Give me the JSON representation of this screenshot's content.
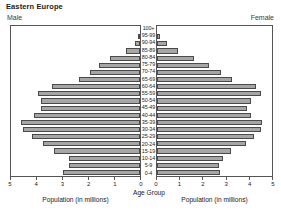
{
  "title": "Eastern Europe",
  "sides": {
    "left_label": "Male",
    "right_label": "Female"
  },
  "axis": {
    "center_caption": "Age Group",
    "left_caption": "Population (in millions)",
    "right_caption": "Population (in millions)",
    "left_ticks": [
      "5",
      "4",
      "3",
      "2",
      "1",
      "0"
    ],
    "right_ticks": [
      "0",
      "1",
      "2",
      "3",
      "4",
      "5"
    ]
  },
  "colors": {
    "bar_fill": "#a6a6a6",
    "bar_stroke": "#4a4a4a",
    "panel_border": "#555555",
    "text": "#1a1a1a"
  },
  "chart_data": {
    "type": "bar",
    "subtype": "population-pyramid",
    "title": "Eastern Europe",
    "xlabel": "Population (in millions)",
    "ylabel": "Age Group",
    "xlim": [
      0,
      5
    ],
    "grid": false,
    "legend_position": "none",
    "orientation": "horizontal",
    "categories": [
      "100+",
      "95-99",
      "90-94",
      "85-89",
      "80-84",
      "75-79",
      "70-74",
      "65-69",
      "60-64",
      "55-59",
      "50-54",
      "45-49",
      "40-44",
      "35-39",
      "30-34",
      "25-29",
      "20-24",
      "15-19",
      "10-14",
      "5-9",
      "0-4"
    ],
    "series": [
      {
        "name": "Male",
        "direction": "left",
        "values": [
          0.02,
          0.06,
          0.18,
          0.55,
          1.15,
          1.6,
          1.95,
          2.35,
          3.4,
          3.95,
          3.85,
          3.85,
          4.1,
          4.6,
          4.55,
          4.2,
          3.75,
          3.35,
          2.75,
          2.75,
          3.0
        ]
      },
      {
        "name": "Female",
        "direction": "right",
        "values": [
          0.03,
          0.15,
          0.45,
          0.9,
          1.6,
          2.25,
          2.8,
          3.25,
          4.3,
          4.5,
          4.1,
          3.9,
          4.1,
          4.55,
          4.5,
          4.2,
          3.85,
          3.2,
          2.85,
          2.7,
          2.75
        ]
      }
    ]
  }
}
